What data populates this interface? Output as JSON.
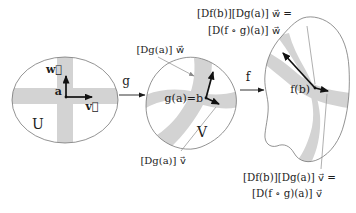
{
  "figure": {
    "background": "#ffffff",
    "band_color": "#d3d3d3",
    "outline_color": "#6f6f6f",
    "vector_color": "#111111",
    "leader_color": "#9b9b9b",
    "text_color": "#1c1c1c"
  },
  "domain_u": {
    "set_label": "U",
    "point_label": "a",
    "w_label": "w⃗",
    "v_label": "v⃗"
  },
  "maps": {
    "g_label": "g",
    "f_label": "f"
  },
  "domain_v": {
    "set_label": "V",
    "point_label": "g(a)=b",
    "w_label": "[Dg(a)] w⃗",
    "v_label": "[Dg(a)] v⃗"
  },
  "codomain": {
    "point_label": "f(b)",
    "w_eq_line1": "[Df(b)][Dg(a)] w⃗ =",
    "w_eq_line2": "[D(f ∘ g)(a)] w⃗",
    "v_eq_line1": "[Df(b)][Dg(a)] v⃗ =",
    "v_eq_line2": "[D(f ∘ g)(a)] v⃗"
  }
}
